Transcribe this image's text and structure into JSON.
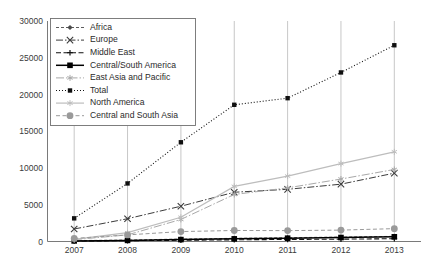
{
  "chart_data": {
    "type": "line",
    "title": "",
    "subtitle": "",
    "xlabel": "",
    "ylabel": "",
    "categories": [
      "2007",
      "2008",
      "2009",
      "2010",
      "2011",
      "2012",
      "2013"
    ],
    "x": [
      2007,
      2008,
      2009,
      2010,
      2011,
      2012,
      2013
    ],
    "ylim": [
      0,
      30000
    ],
    "ytick_values": [
      0,
      5000,
      10000,
      15000,
      20000,
      25000,
      30000
    ],
    "ytick_labels": [
      "0",
      "5000",
      "10000",
      "15000",
      "20000",
      "25000",
      "30000"
    ],
    "xtick_labels": [
      "2007",
      "2008",
      "2009",
      "2010",
      "2011",
      "2012",
      "2013"
    ],
    "grid": "vertical-only",
    "legend_position": "upper-left-inside",
    "series": [
      {
        "name": "Africa",
        "values": [
          120,
          200,
          330,
          430,
          520,
          600,
          700
        ],
        "color": "#4a4a4a",
        "dash": "3,2",
        "width": 0.9,
        "marker": "diamond",
        "marker_size": 2.6
      },
      {
        "name": "Europe",
        "values": [
          1700,
          3100,
          4800,
          6700,
          7100,
          7800,
          9300
        ],
        "color": "#3c3c3c",
        "dash": "7,2,1.5,2",
        "width": 1.0,
        "marker": "x",
        "marker_size": 3.2
      },
      {
        "name": "Middle East",
        "values": [
          60,
          110,
          170,
          230,
          280,
          320,
          380
        ],
        "color": "#111111",
        "dash": "5,2.5",
        "width": 1.1,
        "marker": "plus",
        "marker_size": 2.8
      },
      {
        "name": "Central/South America",
        "values": [
          80,
          150,
          260,
          360,
          450,
          540,
          640
        ],
        "color": "#000000",
        "dash": "none",
        "width": 1.5,
        "marker": "square",
        "marker_size": 2.8
      },
      {
        "name": "East Asia and Pacific",
        "values": [
          250,
          900,
          3000,
          6400,
          7300,
          8500,
          9800
        ],
        "color": "#a8a8a8",
        "dash": "8,2,1.5,2",
        "width": 1.0,
        "marker": "asterisk",
        "marker_size": 3.0
      },
      {
        "name": "Total",
        "values": [
          3150,
          7900,
          13500,
          18600,
          19500,
          23000,
          26700
        ],
        "color": "#101010",
        "dash": "1,2",
        "width": 1.1,
        "marker": "square",
        "marker_size": 2.2
      },
      {
        "name": "North America",
        "values": [
          300,
          1200,
          3300,
          7500,
          8900,
          10600,
          12200
        ],
        "color": "#bdbdbd",
        "dash": "none",
        "width": 1.2,
        "marker": "asterisk",
        "marker_size": 3.0
      },
      {
        "name": "Central and South Asia",
        "values": [
          420,
          900,
          1350,
          1500,
          1480,
          1550,
          1750
        ],
        "color": "#9a9a9a",
        "dash": "4,2.5",
        "width": 1.0,
        "marker": "circle",
        "marker_size": 3.4
      }
    ]
  },
  "legend": {
    "items": [
      {
        "label": "Africa"
      },
      {
        "label": "Europe"
      },
      {
        "label": "Middle East"
      },
      {
        "label": "Central/South America"
      },
      {
        "label": "East Asia and Pacific"
      },
      {
        "label": "Total"
      },
      {
        "label": "North America"
      },
      {
        "label": "Central and South Asia"
      }
    ]
  },
  "colors": {
    "axis": "#6b6b6b",
    "gridline": "#b9b9b9",
    "legend_border": "#707070",
    "background": "#ffffff",
    "tick_text": "#3a3a3a"
  }
}
